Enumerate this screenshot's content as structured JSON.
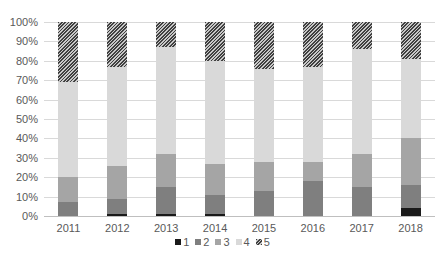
{
  "chart_data": {
    "type": "bar",
    "stacked": "percent",
    "title": "",
    "xlabel": "",
    "ylabel": "",
    "ylim": [
      0,
      100
    ],
    "yticks": [
      "0%",
      "10%",
      "20%",
      "30%",
      "40%",
      "50%",
      "60%",
      "70%",
      "80%",
      "90%",
      "100%"
    ],
    "grid": true,
    "legend_position": "bottom",
    "categories": [
      "2011",
      "2012",
      "2013",
      "2014",
      "2015",
      "2016",
      "2017",
      "2018"
    ],
    "series": [
      {
        "name": "1",
        "color": "#1a1a1a",
        "values": [
          0,
          1,
          1,
          1,
          0,
          0,
          0,
          4
        ]
      },
      {
        "name": "2",
        "color": "#7f7f7f",
        "values": [
          7,
          8,
          14,
          10,
          13,
          18,
          15,
          12
        ]
      },
      {
        "name": "3",
        "color": "#a5a5a5",
        "values": [
          13,
          17,
          17,
          16,
          15,
          10,
          17,
          24
        ]
      },
      {
        "name": "4",
        "color": "#d9d9d9",
        "values": [
          49,
          51,
          55,
          53,
          48,
          49,
          54,
          41
        ]
      },
      {
        "name": "5",
        "color": "#595959",
        "pattern": "diagonal-hatch",
        "values": [
          31,
          23,
          13,
          20,
          24,
          23,
          14,
          19
        ]
      }
    ]
  }
}
